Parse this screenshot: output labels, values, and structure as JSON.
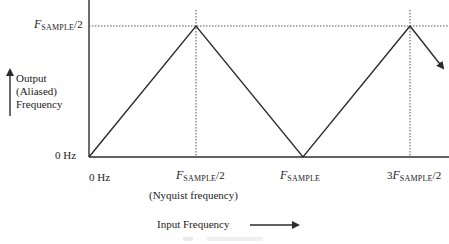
{
  "diagram": {
    "y_axis": {
      "label_lines": [
        "Output",
        "(Aliased)",
        "Frequency"
      ],
      "ticks": [
        {
          "label_main": "F",
          "label_sub": "SAMPLE",
          "label_tail": "/2"
        },
        {
          "label": "0 Hz"
        }
      ]
    },
    "x_axis": {
      "label": "Input Frequency",
      "ticks": [
        {
          "label": "0 Hz"
        },
        {
          "label_main": "F",
          "label_sub": "SAMPLE",
          "label_tail": "/2",
          "note": "(Nyquist frequency)"
        },
        {
          "label_main": "F",
          "label_sub": "SAMPLE",
          "label_tail": ""
        },
        {
          "label_prefix": "3",
          "label_main": "F",
          "label_sub": "SAMPLE",
          "label_tail": "/2"
        }
      ]
    },
    "curve": {
      "description": "Triangular folding: output rises 0 → Fs/2, falls to 0 at Fs, rises to Fs/2 at 3Fs/2, then continues falling (arrow)",
      "points_normalized": [
        [
          0,
          0
        ],
        [
          0.5,
          0.5
        ],
        [
          1.0,
          0
        ],
        [
          1.5,
          0.5
        ],
        [
          1.67,
          0.33
        ]
      ]
    },
    "colors": {
      "line": "#2b2b2b",
      "dotted": "#555555",
      "text": "#222222"
    }
  }
}
